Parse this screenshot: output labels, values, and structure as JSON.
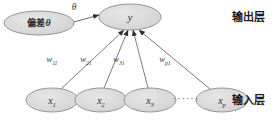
{
  "figure": {
    "type": "neural-network-diagram"
  },
  "style": {
    "node_fill": "#d9d9d9",
    "node_stroke": "#8a8a8a",
    "edge_color": "#5a5a5a",
    "text_color": "#2b2b2b",
    "background": "#ffffff"
  },
  "nodes": {
    "bias": {
      "label": "偏差",
      "symbol": "θ",
      "cx": 39,
      "cy": 23,
      "rx": 35,
      "ry": 12
    },
    "output": {
      "label": "y",
      "cx": 130,
      "cy": 17,
      "rx": 31,
      "ry": 13
    },
    "inputs": [
      {
        "label": "x",
        "sub": "1",
        "cx": 52,
        "cy": 100,
        "rx": 26,
        "ry": 12
      },
      {
        "label": "x",
        "sub": "2",
        "cx": 101,
        "cy": 100,
        "rx": 26,
        "ry": 12
      },
      {
        "label": "x",
        "sub": "3",
        "cx": 150,
        "cy": 100,
        "rx": 26,
        "ry": 12
      },
      {
        "label": "x",
        "sub": "p",
        "cx": 222,
        "cy": 100,
        "rx": 26,
        "ry": 12
      }
    ],
    "ellipsis": {
      "text": "······",
      "x": 186,
      "y": 102
    }
  },
  "edges": {
    "bias_to_output": {
      "label": "θ",
      "label_x": 74,
      "label_y": 10,
      "x1": 74,
      "y1": 22,
      "x2": 99,
      "y2": 15
    },
    "inputs_to_output": [
      {
        "label": "w",
        "sub": "11",
        "label_x": 52,
        "label_y": 62,
        "x1": 61,
        "y1": 89,
        "x2": 124,
        "y2": 30
      },
      {
        "label": "w",
        "sub": "21",
        "label_x": 86,
        "label_y": 62,
        "x1": 104,
        "y1": 88,
        "x2": 128,
        "y2": 30
      },
      {
        "label": "w",
        "sub": "31",
        "label_x": 119,
        "label_y": 62,
        "x1": 148,
        "y1": 88,
        "x2": 133,
        "y2": 30
      },
      {
        "label": "w",
        "sub": "p1",
        "label_x": 165,
        "label_y": 62,
        "x1": 210,
        "y1": 89,
        "x2": 139,
        "y2": 30
      }
    ]
  },
  "layer_labels": {
    "output_layer": {
      "text": "输出层",
      "x": 232,
      "y": 21
    },
    "input_layer": {
      "text": "输入层",
      "x": 232,
      "y": 104
    }
  }
}
